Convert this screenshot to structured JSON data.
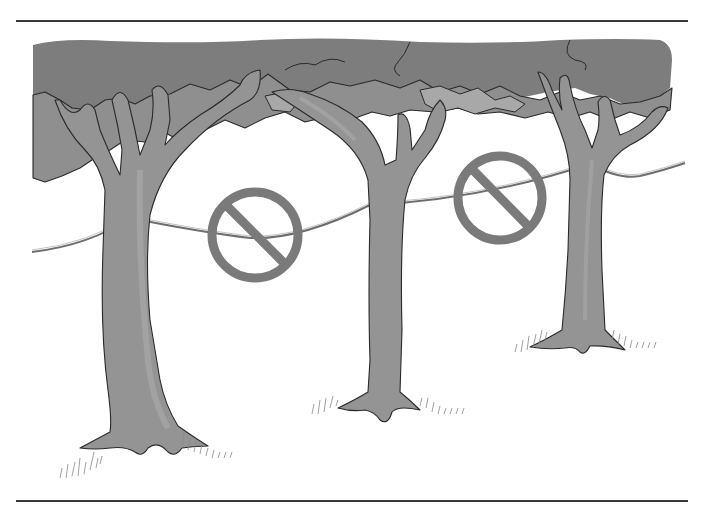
{
  "illustration": {
    "subject": "Three trees with a rope/wire tied between trunks, each span marked with a prohibition sign",
    "colors": {
      "background": "#ffffff",
      "canopy_dark": "#7d7d7d",
      "canopy_mid": "#8f8f8f",
      "canopy_light": "#a8a8a8",
      "trunk": "#949494",
      "trunk_highlight": "#a6a6a6",
      "outline": "#2a2a2a",
      "rule_line": "#3a3a3a",
      "prohibition_sign": "#7a7a7a",
      "grass": "#888888"
    },
    "elements": {
      "trees": [
        "left-tree",
        "middle-tree",
        "right-tree"
      ],
      "rope": "rope-between-trees",
      "signs": [
        "no-symbol-left-span",
        "no-symbol-right-span"
      ]
    }
  }
}
